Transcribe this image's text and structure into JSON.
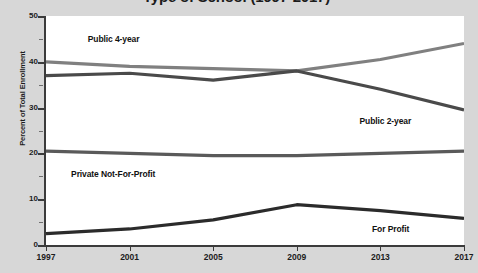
{
  "chart_data": {
    "type": "line",
    "title": "Type of School (1997-2017)",
    "xlabel": "",
    "ylabel": "Percent of Total Enrollment",
    "categories": [
      "1997",
      "2001",
      "2005",
      "2009",
      "2013",
      "2017"
    ],
    "x": [
      1997,
      2001,
      2005,
      2009,
      2013,
      2017
    ],
    "xlim": [
      1997,
      2017
    ],
    "ylim": [
      0,
      50
    ],
    "y_ticks": [
      0,
      10,
      20,
      30,
      40,
      50
    ],
    "y_minor_ticks": [
      5,
      15,
      25,
      35,
      45
    ],
    "grid": false,
    "legend": "inline-series-labels",
    "series": [
      {
        "name": "Public 4-year",
        "color": "#808080",
        "values": [
          40.0,
          39.0,
          38.5,
          38.0,
          40.5,
          44.0
        ],
        "label_x": 1999.0,
        "label_y": 45.0
      },
      {
        "name": "Public 2-year",
        "color": "#4a4a4a",
        "values": [
          37.0,
          37.5,
          36.0,
          38.0,
          34.0,
          29.5
        ],
        "label_x": 2012.0,
        "label_y": 27.0
      },
      {
        "name": "Private Not-For-Profit",
        "color": "#5a5a5a",
        "values": [
          20.5,
          20.0,
          19.5,
          19.5,
          20.0,
          20.5
        ],
        "label_x": 1998.2,
        "label_y": 15.5
      },
      {
        "name": "For Profit",
        "color": "#2b2b2b",
        "values": [
          2.5,
          3.5,
          5.5,
          8.8,
          7.5,
          5.8
        ],
        "label_x": 2012.6,
        "label_y": 3.5
      }
    ]
  },
  "axis": {
    "y_labels": [
      "0",
      "10",
      "20",
      "30",
      "40",
      "50"
    ],
    "x_labels": [
      "1997",
      "2001",
      "2005",
      "2009",
      "2013",
      "2017"
    ]
  }
}
